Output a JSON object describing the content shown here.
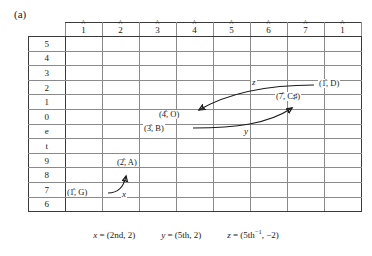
{
  "figure": {
    "panel_label": "(a)",
    "columns": [
      {
        "degree": "1",
        "accent": "^"
      },
      {
        "degree": "2",
        "accent": "^"
      },
      {
        "degree": "3",
        "accent": "^"
      },
      {
        "degree": "4",
        "accent": "^"
      },
      {
        "degree": "5",
        "accent": "^"
      },
      {
        "degree": "6",
        "accent": "^"
      },
      {
        "degree": "7",
        "accent": "^"
      },
      {
        "degree": "1",
        "accent": "^"
      }
    ],
    "rows": [
      "5",
      "4",
      "3",
      "2",
      "1",
      "0",
      "e",
      "t",
      "9",
      "8",
      "7",
      "6"
    ],
    "nodes": [
      {
        "id": "n-1-D",
        "label": "(1̂, D)",
        "col": 8,
        "row": "2"
      },
      {
        "id": "n-7-Cs",
        "label": "(7̂, C♯)",
        "col": 7,
        "row": "1"
      },
      {
        "id": "n-4-O",
        "label": "(4̂, O)",
        "col": 4,
        "row": "0"
      },
      {
        "id": "n-3-B",
        "label": "(3̂, B)",
        "col": 3,
        "row": "0"
      },
      {
        "id": "n-2-A",
        "label": "(2̂, A)",
        "col": 2,
        "row": "9"
      },
      {
        "id": "n-1-G",
        "label": "(1̂, G)",
        "col": 1,
        "row": "7"
      }
    ],
    "arrows": [
      {
        "id": "arrow-x",
        "label": "x",
        "from": "n-1-G",
        "to": "n-2-A"
      },
      {
        "id": "arrow-y",
        "label": "y",
        "from": "n-3-B",
        "to": "n-7-Cs"
      },
      {
        "id": "arrow-z",
        "label": "z",
        "from": "n-1-D",
        "to": "n-4-O"
      }
    ],
    "caption": [
      {
        "var": "x",
        "value": "= (2nd, 2)"
      },
      {
        "var": "y",
        "value": "= (5th, 2)"
      },
      {
        "var": "z",
        "value": "= (5th",
        "sup": "−1",
        "tail": ", −2)"
      }
    ],
    "colors": {
      "ink": "#1a1a1a",
      "grid_light": "#8a8a8a",
      "grid_heavy": "#3a3a3a",
      "background": "#ffffff"
    }
  }
}
